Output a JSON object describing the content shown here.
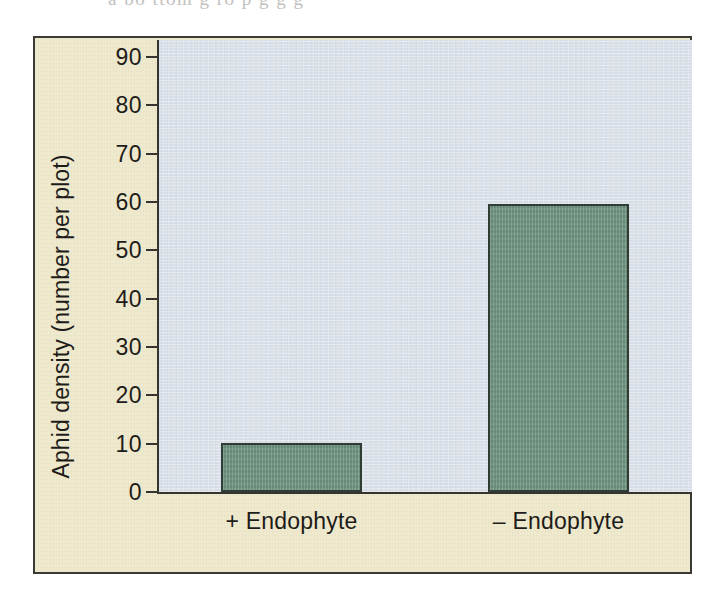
{
  "figure": {
    "top_text_fragment": "a  bo ttom g  ro p     g               g               g",
    "frame_fill_color": "#efe9cd",
    "frame_border_color": "#3b3a35",
    "plot_background_color": "#dce3ec"
  },
  "chart_data": {
    "type": "bar",
    "title": "",
    "subtitle": "",
    "xlabel": "",
    "ylabel": "Aphid density (number per plot)",
    "categories": [
      "+ Endophyte",
      "– Endophyte"
    ],
    "values": [
      10.2,
      59.5
    ],
    "ylim": [
      0,
      90
    ],
    "yticks": [
      0,
      10,
      20,
      30,
      40,
      50,
      60,
      70,
      80,
      90
    ],
    "ytick_labels": [
      "0",
      "10",
      "20",
      "30",
      "40",
      "50",
      "60",
      "70",
      "80",
      "90"
    ],
    "grid": false,
    "legend": null,
    "bar_fill_color": "#729784",
    "bar_edge_color": "#2f3d35",
    "axis_color": "#35342f"
  }
}
